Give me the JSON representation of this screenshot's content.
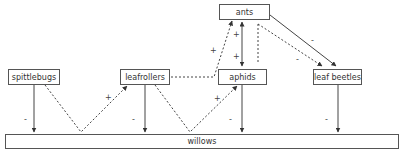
{
  "diagram": {
    "nodes": {
      "ants": "ants",
      "spittlebugs": "spittlebugs",
      "leafrollers": "leafrollers",
      "aphids": "aphids",
      "leaf_beetles": "leaf beetles",
      "willows": "willows"
    },
    "signs": {
      "spittlebugs_willows": "-",
      "leafrollers_willows": "-",
      "aphids_willows": "-",
      "leafbeetles_willows": "-",
      "spittlebugs_leafrollers": "+",
      "leafrollers_aphids": "+",
      "leafrollers_ants": "+",
      "ants_aphids_up": "+",
      "ants_aphids_down": "+",
      "ants_leafbeetles_solid": "-",
      "ants_leafbeetles_dashed": "-"
    },
    "edges": [
      {
        "from": "spittlebugs",
        "to": "willows",
        "style": "solid",
        "sign": "-"
      },
      {
        "from": "leafrollers",
        "to": "willows",
        "style": "solid",
        "sign": "-"
      },
      {
        "from": "aphids",
        "to": "willows",
        "style": "solid",
        "sign": "-"
      },
      {
        "from": "leaf beetles",
        "to": "willows",
        "style": "solid",
        "sign": "-"
      },
      {
        "from": "spittlebugs",
        "to": "leafrollers",
        "style": "dashed",
        "sign": "+"
      },
      {
        "from": "leafrollers",
        "to": "aphids",
        "style": "dashed",
        "sign": "+"
      },
      {
        "from": "leafrollers",
        "to": "ants",
        "style": "dashed",
        "sign": "+"
      },
      {
        "from": "ants",
        "to": "aphids",
        "style": "solid-bidirectional",
        "sign": "+"
      },
      {
        "from": "ants",
        "to": "leaf beetles",
        "style": "solid",
        "sign": "-"
      },
      {
        "from": "ants",
        "to": "leaf beetles",
        "style": "dashed",
        "sign": "-"
      }
    ]
  }
}
